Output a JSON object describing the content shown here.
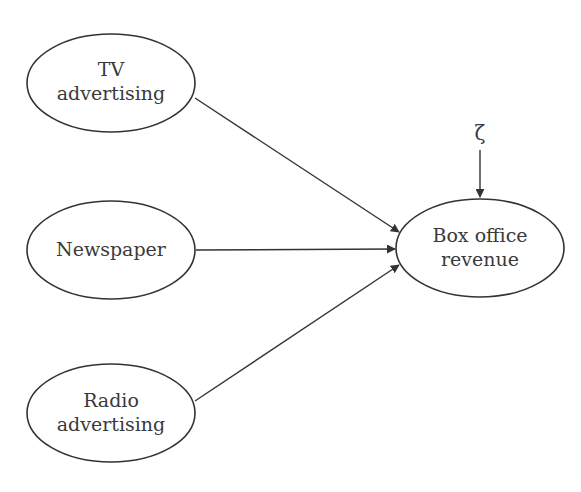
{
  "diagram": {
    "type": "path-diagram",
    "nodes": [
      {
        "id": "tv",
        "line1": "TV",
        "line2": "advertising"
      },
      {
        "id": "newspaper",
        "line1": "Newspaper"
      },
      {
        "id": "radio",
        "line1": "Radio",
        "line2": "advertising"
      },
      {
        "id": "box_office",
        "line1": "Box office",
        "line2": "revenue"
      }
    ],
    "error_term": {
      "symbol": "ζ",
      "target": "box_office"
    },
    "edges": [
      {
        "from": "tv",
        "to": "box_office"
      },
      {
        "from": "newspaper",
        "to": "box_office"
      },
      {
        "from": "radio",
        "to": "box_office"
      },
      {
        "from": "error_term",
        "to": "box_office"
      }
    ],
    "colors": {
      "stroke": "#333333",
      "text": "#3a3a3a",
      "background": "#ffffff"
    }
  }
}
